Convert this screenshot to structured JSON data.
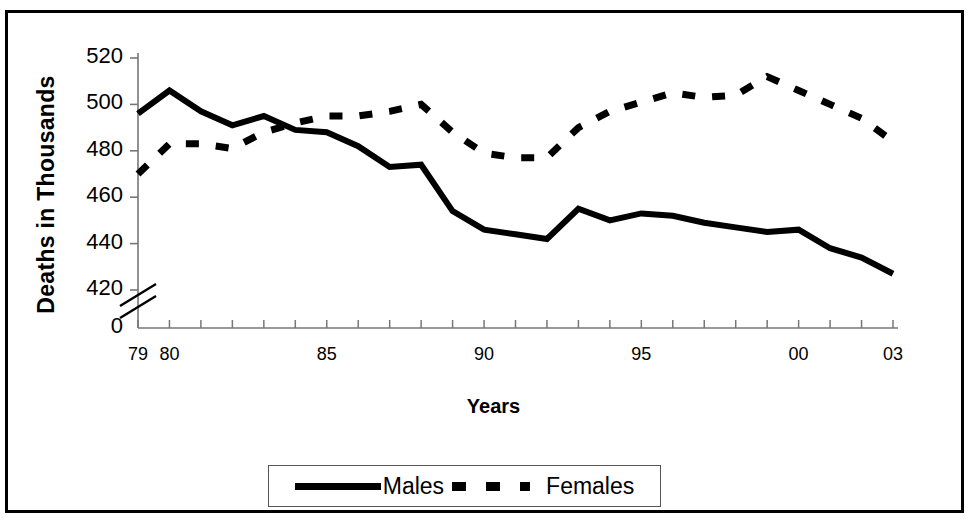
{
  "chart_data": {
    "type": "line",
    "title": "",
    "xlabel": "Years",
    "ylabel": "Deaths in Thousands",
    "x": [
      1979,
      1980,
      1981,
      1982,
      1983,
      1984,
      1985,
      1986,
      1987,
      1988,
      1989,
      1990,
      1991,
      1992,
      1993,
      1994,
      1995,
      1996,
      1997,
      1998,
      1999,
      2000,
      2001,
      2002,
      2003
    ],
    "x_tick_labels_shown": [
      "79",
      "80",
      "85",
      "90",
      "95",
      "00",
      "03"
    ],
    "x_tick_label_years": [
      1979,
      1980,
      1985,
      1990,
      1995,
      2000,
      2003
    ],
    "y_tick_labels": [
      "520",
      "500",
      "480",
      "460",
      "440",
      "420",
      "0"
    ],
    "y_tick_values": [
      520,
      500,
      480,
      460,
      440,
      420,
      0
    ],
    "ylim": [
      420,
      520
    ],
    "axis_break": true,
    "grid": false,
    "legend_position": "bottom",
    "series": [
      {
        "name": "Males",
        "style": "solid",
        "color": "#000000",
        "values": [
          496,
          506,
          497,
          491,
          495,
          489,
          488,
          482,
          473,
          474,
          454,
          446,
          444,
          442,
          455,
          450,
          453,
          452,
          449,
          447,
          445,
          446,
          438,
          434,
          427
        ]
      },
      {
        "name": "Females",
        "style": "dashed",
        "color": "#000000",
        "values": [
          470,
          483,
          483,
          481,
          488,
          492,
          495,
          495,
          497,
          500,
          488,
          479,
          477,
          477,
          490,
          497,
          501,
          505,
          503,
          504,
          512,
          506,
          500,
          494,
          484
        ]
      }
    ]
  },
  "legend": {
    "entries": [
      {
        "label": "Males",
        "style": "solid"
      },
      {
        "label": "Females",
        "style": "dashed"
      }
    ]
  },
  "axis_titles": {
    "y": "Deaths in Thousands",
    "x": "Years"
  }
}
